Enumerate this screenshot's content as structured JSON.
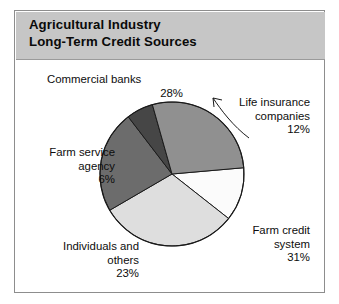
{
  "header": {
    "title_line1": "Agricultural Industry",
    "title_line2": "Long-Term Credit Sources",
    "background_color": "#c6c6c6"
  },
  "chart_data": {
    "type": "pie",
    "title": "Agricultural Industry Long-Term Credit Sources",
    "subtitle": "",
    "xlabel": "",
    "ylabel": "",
    "grid": false,
    "legend_position": "callout-labels",
    "units": "percent",
    "total": 100,
    "start_angle_deg": -5,
    "direction": "clockwise",
    "categories": [
      "Life insurance companies",
      "Farm credit system",
      "Individuals and others",
      "Farm service agency",
      "Commercial banks"
    ],
    "values": [
      12,
      31,
      23,
      6,
      28
    ],
    "slices": [
      {
        "label_line1": "Life insurance",
        "label_line2": "companies",
        "label_full": "Life insurance companies",
        "percent_text": "12%",
        "value": 12,
        "color": "#fbfbfb"
      },
      {
        "label_line1": "Farm credit",
        "label_line2": "system",
        "label_full": "Farm credit system",
        "percent_text": "31%",
        "value": 31,
        "color": "#dedede"
      },
      {
        "label_line1": "Individuals and",
        "label_line2": "others",
        "label_full": "Individuals and others",
        "percent_text": "23%",
        "value": 23,
        "color": "#6c6c6c"
      },
      {
        "label_line1": "Farm service",
        "label_line2": "agency",
        "label_full": "Farm service agency",
        "percent_text": "6%",
        "value": 6,
        "color": "#464646"
      },
      {
        "label_line1": "Commercial banks",
        "label_line2": "",
        "label_full": "Commercial banks",
        "percent_text": "28%",
        "value": 28,
        "color": "#909090"
      }
    ]
  },
  "figure": {
    "border_color": "#8d8d8d",
    "background_color": "#ffffff",
    "slice_outline_color": "#1a1a1a"
  }
}
